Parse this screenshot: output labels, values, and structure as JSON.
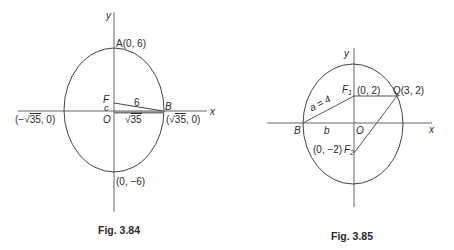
{
  "figures": [
    {
      "caption": "Fig. 3.84",
      "axes": {
        "x_label": "x",
        "y_label": "y"
      },
      "labels": {
        "A": "A(0, 6)",
        "bottom": "(0, −6)",
        "F": "F",
        "c": "c",
        "O": "O",
        "B": "B",
        "six": "6",
        "sqrt35_root": "√",
        "sqrt35_val": "35",
        "left_vertex_prefix": "(−",
        "left_vertex_root": "√",
        "left_vertex_val": "35",
        "left_vertex_suffix": ", 0)",
        "right_vertex_prefix": "(",
        "right_vertex_root": "√",
        "right_vertex_val": "35",
        "right_vertex_suffix": ", 0)"
      },
      "geometry": {
        "ellipse": {
          "center": [
            0,
            0
          ],
          "semi_major_y": 6,
          "semi_minor_x": "sqrt(35)"
        },
        "points": {
          "A": [
            0,
            6
          ],
          "bottom": [
            0,
            -6
          ],
          "B": [
            "sqrt(35)",
            0
          ],
          "left": [
            "-sqrt(35)",
            0
          ],
          "F": [
            0,
            "c"
          ]
        },
        "segments": [
          [
            "F",
            "B",
            "6"
          ],
          [
            "O",
            "B",
            "sqrt(35)"
          ]
        ]
      }
    },
    {
      "caption": "Fig. 3.85",
      "axes": {
        "x_label": "x",
        "y_label": "y"
      },
      "labels": {
        "F1": "F",
        "F1_sub": "1",
        "F1_coord": "(0, 2)",
        "Q": "Q(3, 2)",
        "F2_coord": "(0, −2)",
        "F2": "F",
        "F2_sub": "2",
        "a": "a = 4",
        "B": "B",
        "b": "b",
        "O": "O"
      },
      "geometry": {
        "ellipse": {
          "center": [
            0,
            0
          ],
          "foci": [
            [
              0,
              2
            ],
            [
              0,
              -2
            ]
          ],
          "a": 4
        },
        "points": {
          "F1": [
            0,
            2
          ],
          "F2": [
            0,
            -2
          ],
          "Q": [
            3,
            2
          ],
          "B": [
            "-b",
            0
          ],
          "O": [
            0,
            0
          ]
        },
        "segments": [
          [
            "B",
            "F1",
            "a = 4"
          ],
          [
            "F1",
            "Q"
          ],
          [
            "Q",
            "F2"
          ],
          [
            "B",
            "O",
            "b"
          ]
        ]
      }
    }
  ]
}
